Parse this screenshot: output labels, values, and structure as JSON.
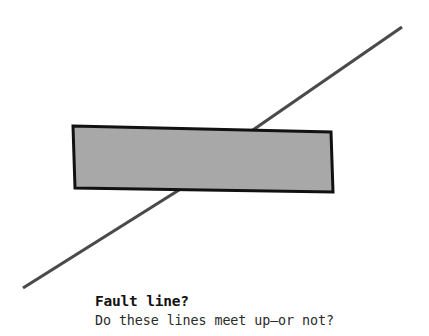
{
  "canvas": {
    "width": 429,
    "height": 336,
    "background_color": "#ffffff"
  },
  "figure": {
    "name": "poggendorff-illusion",
    "line": {
      "label": "diagonal-line",
      "color": "#4a4a4a",
      "thickness_px": 3,
      "start_point": {
        "x": 23,
        "y": 288
      },
      "end_point": {
        "x": 402,
        "y": 27
      },
      "occluded_entry_point": {
        "x": 176,
        "y": 190
      },
      "occluded_exit_point": {
        "x": 253,
        "y": 130
      }
    },
    "bar": {
      "label": "occluding-bar",
      "fill_color": "#a8a8a8",
      "border_color": "#111111",
      "border_width_px": 3,
      "rotation_degrees": 1.5,
      "corners": [
        {
          "x": 73,
          "y": 126
        },
        {
          "x": 331,
          "y": 132
        },
        {
          "x": 333,
          "y": 192
        },
        {
          "x": 75,
          "y": 188
        }
      ]
    }
  },
  "caption": {
    "title": "Fault line?",
    "subtitle": "Do these lines meet up—or not?"
  }
}
